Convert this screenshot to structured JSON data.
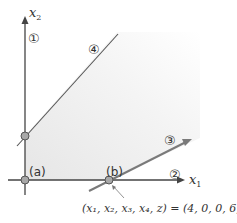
{
  "diagram": {
    "axes": {
      "x_label": "x",
      "x_sub": "1",
      "y_label": "x",
      "y_sub": "2"
    },
    "constraint_labels": {
      "c1": "①",
      "c2": "②",
      "c3": "③",
      "c4": "④"
    },
    "points": {
      "a": "(a)",
      "b": "(b)"
    },
    "annotation": "(x₁, x₂, x₃, x₄, z) = (4, 0, 0, 6, 8)",
    "colors": {
      "axis": "#444444",
      "line4": "#555555",
      "line3": "#7a7a7a",
      "region": "#ececec",
      "point_fill": "#a8a8a8"
    }
  }
}
